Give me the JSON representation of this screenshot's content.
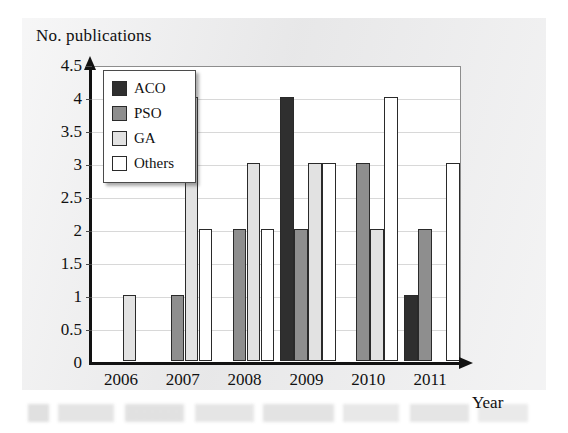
{
  "figure": {
    "ylabel": "No. publications",
    "xlabel": "Year"
  },
  "legend": {
    "items": [
      {
        "label": "ACO",
        "key": "aco",
        "color": "#2f2f2f"
      },
      {
        "label": "PSO",
        "key": "pso",
        "color": "#8e8e8e"
      },
      {
        "label": "GA",
        "key": "ga",
        "color": "#e2e2e2"
      },
      {
        "label": "Others",
        "key": "others",
        "color": "#ffffff"
      }
    ]
  },
  "chart_data": {
    "type": "bar",
    "title": "",
    "xlabel": "Year",
    "ylabel": "No. publications",
    "categories": [
      "2006",
      "2007",
      "2008",
      "2009",
      "2010",
      "2011"
    ],
    "series": [
      {
        "name": "ACO",
        "color": "#2f2f2f",
        "values": [
          0,
          0,
          0,
          4,
          0,
          1
        ]
      },
      {
        "name": "PSO",
        "color": "#8e8e8e",
        "values": [
          0,
          1,
          2,
          2,
          3,
          2
        ]
      },
      {
        "name": "GA",
        "color": "#e2e2e2",
        "values": [
          1,
          4,
          3,
          3,
          2,
          0
        ]
      },
      {
        "name": "Others",
        "color": "#ffffff",
        "values": [
          0,
          2,
          2,
          3,
          4,
          3
        ]
      }
    ],
    "ylim": [
      0,
      4.5
    ],
    "ytick_labels": [
      "0",
      "0.5",
      "1",
      "1.5",
      "2",
      "2.5",
      "3",
      "3.5",
      "4",
      "4.5"
    ],
    "ytick_values": [
      0,
      0.5,
      1,
      1.5,
      2,
      2.5,
      3,
      3.5,
      4,
      4.5
    ],
    "ytick_step": 0.5,
    "grid": true,
    "legend_position": "upper-left"
  }
}
